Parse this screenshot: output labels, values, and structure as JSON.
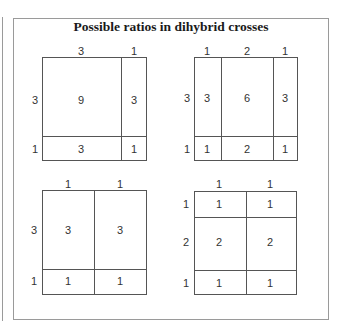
{
  "title": "Possible ratios in dihybrid crosses",
  "squares": [
    {
      "name": "ratio-9-3-3-1",
      "top_labels": [
        "3",
        "1"
      ],
      "left_labels": [
        "3",
        "1"
      ],
      "cells": [
        [
          "9",
          "3"
        ],
        [
          "3",
          "1"
        ]
      ]
    },
    {
      "name": "ratio-3-6-3-1-2-1",
      "top_labels": [
        "1",
        "2",
        "1"
      ],
      "left_labels": [
        "3",
        "1"
      ],
      "cells": [
        [
          "3",
          "6",
          "3"
        ],
        [
          "1",
          "2",
          "1"
        ]
      ]
    },
    {
      "name": "ratio-3-3-1-1",
      "top_labels": [
        "1",
        "1"
      ],
      "left_labels": [
        "3",
        "1"
      ],
      "cells": [
        [
          "3",
          "3"
        ],
        [
          "1",
          "1"
        ]
      ]
    },
    {
      "name": "ratio-1-1-2-2-1-1",
      "top_labels": [
        "1",
        "1"
      ],
      "left_labels": [
        "1",
        "2",
        "1"
      ],
      "cells": [
        [
          "1",
          "1"
        ],
        [
          "2",
          "2"
        ],
        [
          "1",
          "1"
        ]
      ]
    }
  ]
}
